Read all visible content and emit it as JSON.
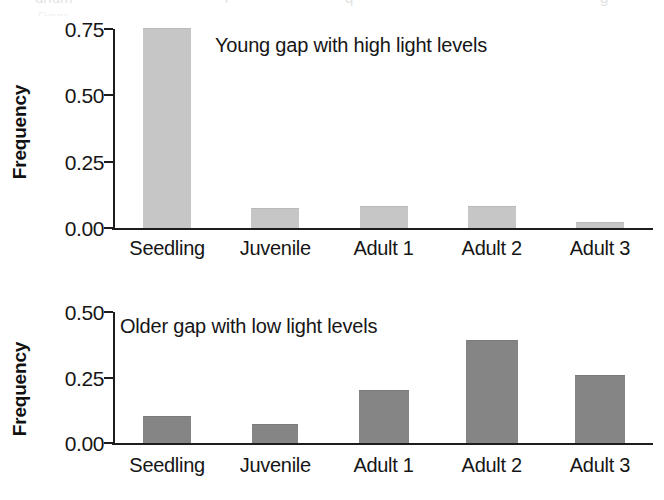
{
  "figure": {
    "background": "#ffffff",
    "axis_color": "#1d1d1d",
    "text_color": "#161616"
  },
  "scan_artifacts": {
    "remnant_a": "unum",
    "remnant_b": "i",
    "remnant_c": "q",
    "remnant_d": "g",
    "remnant_faint": "Figure"
  },
  "panels": {
    "top": {
      "ylabel": "Frequency",
      "annotation": "Young gap with high light levels",
      "bar_color": "#c6c6c6",
      "bar_edge": "#b9b9b9"
    },
    "bottom": {
      "ylabel": "Frequency",
      "annotation": "Older gap with low light levels",
      "bar_color": "#858585",
      "bar_edge": "#7b7b7b"
    }
  },
  "chart_data": [
    {
      "type": "bar",
      "title": "Young gap with high light levels",
      "xlabel": "",
      "ylabel": "Frequency",
      "categories": [
        "Seedling",
        "Juvenile",
        "Adult 1",
        "Adult 2",
        "Adult 3"
      ],
      "values": [
        0.75,
        0.07,
        0.08,
        0.08,
        0.02
      ],
      "ylim": [
        0.0,
        0.75
      ],
      "yticks": [
        0.0,
        0.25,
        0.5,
        0.75
      ],
      "ytick_labels": [
        "0.00",
        "0.25",
        "0.50",
        "0.75"
      ],
      "grid": false,
      "legend": false,
      "bar_color": "#c6c6c6",
      "annotation_position": "inside-top-left"
    },
    {
      "type": "bar",
      "title": "Older gap with low light levels",
      "xlabel": "",
      "ylabel": "Frequency",
      "categories": [
        "Seedling",
        "Juvenile",
        "Adult 1",
        "Adult 2",
        "Adult 3"
      ],
      "values": [
        0.1,
        0.07,
        0.2,
        0.39,
        0.255
      ],
      "ylim": [
        0.0,
        0.5
      ],
      "yticks": [
        0.0,
        0.25,
        0.5
      ],
      "ytick_labels": [
        "0.00",
        "0.25",
        "0.50"
      ],
      "grid": false,
      "legend": false,
      "bar_color": "#858585",
      "annotation_position": "inside-top-left"
    }
  ]
}
